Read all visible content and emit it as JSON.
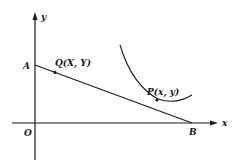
{
  "diagram": {
    "axes": {
      "x_label": "x",
      "y_label": "y",
      "origin_label": "O"
    },
    "points": {
      "A": {
        "label": "A"
      },
      "B": {
        "label": "B"
      },
      "Q": {
        "label": "Q(X, Y)"
      },
      "P": {
        "label": "P(x, y)"
      }
    },
    "colors": {
      "ink": "#1a1a1a",
      "background": "#ffffff"
    }
  }
}
